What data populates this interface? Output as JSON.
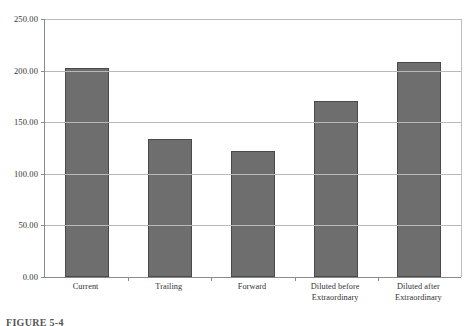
{
  "chart_data": {
    "type": "bar",
    "title": "",
    "xlabel": "",
    "ylabel": "",
    "categories": [
      "Current",
      "Trailing",
      "Forward",
      "Diluted before\nExtraordinary",
      "Diluted after\nExtraordinary"
    ],
    "category_lines": [
      [
        "Current"
      ],
      [
        "Trailing"
      ],
      [
        "Forward"
      ],
      [
        "Diluted before",
        "Extraordinary"
      ],
      [
        "Diluted after",
        "Extraordinary"
      ]
    ],
    "values": [
      203.0,
      134.0,
      122.0,
      171.0,
      208.0
    ],
    "ylim": [
      0,
      250
    ],
    "yticks": [
      0,
      50,
      100,
      150,
      200,
      250
    ],
    "ytick_labels": [
      "0.00",
      "50.00",
      "100.00",
      "150.00",
      "200.00",
      "250.00"
    ],
    "grid": true,
    "legend": false,
    "bar_color": "#6e6e6e",
    "bar_edge_color": "#4a4a4a",
    "grid_color": "#b9b9b9",
    "axis_color": "#8a8a8a",
    "text_color": "#333333"
  },
  "caption": {
    "text": "FIGURE 5-4"
  }
}
